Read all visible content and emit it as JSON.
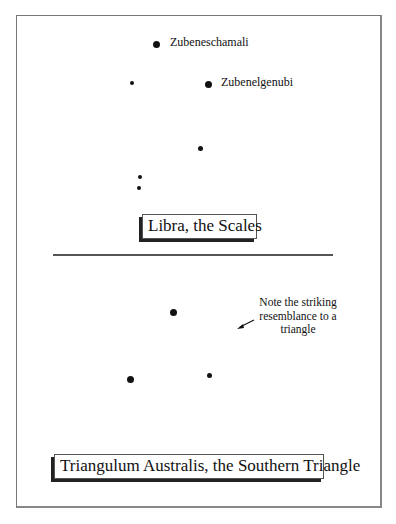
{
  "libra": {
    "title": "Libra, the Scales",
    "stars": [
      {
        "name": "Zubeneschamali",
        "x": 156,
        "y": 44,
        "size": 6
      },
      {
        "name": "",
        "x": 132,
        "y": 83,
        "size": 4
      },
      {
        "name": "Zubenelgenubi",
        "x": 208,
        "y": 84,
        "size": 6
      },
      {
        "name": "",
        "x": 200,
        "y": 148,
        "size": 4
      },
      {
        "name": "",
        "x": 140,
        "y": 177,
        "size": 4
      },
      {
        "name": "",
        "x": 139,
        "y": 188,
        "size": 4
      }
    ],
    "labels": {
      "zubeneschamali": "Zubeneschamali",
      "zubenelgenubi": "Zubenelgenubi"
    }
  },
  "triangulum": {
    "title": "Triangulum Australis, the Southern Triangle",
    "stars": [
      {
        "x": 174,
        "y": 313,
        "size": 6
      },
      {
        "x": 130,
        "y": 380,
        "size": 6
      },
      {
        "x": 209,
        "y": 375,
        "size": 5
      }
    ],
    "note": "Note the striking resemblance to a triangle"
  }
}
